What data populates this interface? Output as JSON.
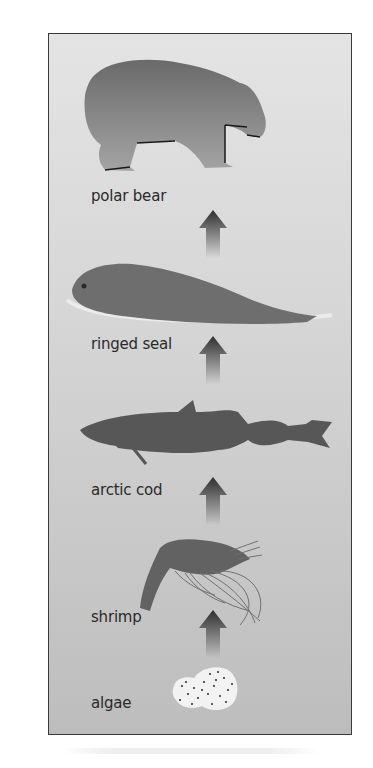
{
  "diagram": {
    "type": "food-chain",
    "direction": "bottom-to-top",
    "colors": {
      "background_top": "#e4e4e4",
      "background_bottom": "#bdbdbd",
      "organism_fill": "#707070",
      "arrow_fill": "#3a3a3a",
      "frame_border": "#3a3a3a",
      "algae_fill": "#f2f2f2"
    },
    "levels": [
      {
        "id": "polar-bear",
        "label": "polar bear"
      },
      {
        "id": "ringed-seal",
        "label": "ringed seal"
      },
      {
        "id": "arctic-cod",
        "label": "arctic cod"
      },
      {
        "id": "shrimp",
        "label": "shrimp"
      },
      {
        "id": "algae",
        "label": "algae"
      }
    ],
    "arrows": [
      {
        "from": "algae",
        "to": "shrimp"
      },
      {
        "from": "shrimp",
        "to": "arctic-cod"
      },
      {
        "from": "arctic-cod",
        "to": "ringed-seal"
      },
      {
        "from": "ringed-seal",
        "to": "polar-bear"
      }
    ]
  }
}
